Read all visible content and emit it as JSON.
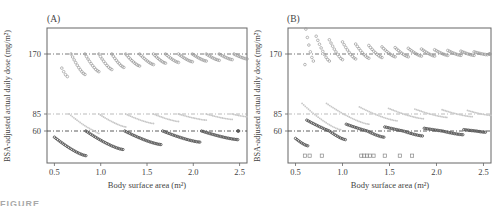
{
  "figure_caption": "FIGURE",
  "chart_data": [
    {
      "type": "scatter",
      "panel_label": "(A)",
      "title": "",
      "xlabel": "Body surface area (m²)",
      "ylabel": "BSA-adjusted actual daily dose (mg/m²)",
      "xlim": [
        0.42,
        2.58
      ],
      "xticks": [
        0.5,
        1.0,
        1.5,
        2.0,
        2.5
      ],
      "xtick_labels": [
        "0.5",
        "1.0",
        "1.5",
        "2.0",
        "2.5"
      ],
      "yticks": [
        60,
        85,
        170
      ],
      "ytick_labels": [
        "60",
        "85",
        "170"
      ],
      "reference_lines": [
        {
          "y": 170,
          "style": "dash-dot",
          "color": "#555555"
        },
        {
          "y": 85,
          "style": "dash-dot",
          "color": "#aaaaaa"
        },
        {
          "y": 60,
          "style": "dash-dot",
          "color": "#333333"
        }
      ],
      "grid": false,
      "series": [
        {
          "name": "target 170 mg/m²",
          "color": "#9a9a9a",
          "marker": "circle-open",
          "segments": [
            {
              "x0": 0.58,
              "x1": 0.64,
              "y0": 150,
              "y1": 138
            },
            {
              "x0": 0.68,
              "x1": 0.83,
              "y0": 170,
              "y1": 141
            },
            {
              "x0": 0.83,
              "x1": 0.98,
              "y0": 170,
              "y1": 145
            },
            {
              "x0": 0.98,
              "x1": 1.12,
              "y0": 170,
              "y1": 148
            },
            {
              "x0": 1.12,
              "x1": 1.25,
              "y0": 170,
              "y1": 151
            },
            {
              "x0": 1.27,
              "x1": 1.42,
              "y0": 170,
              "y1": 153
            },
            {
              "x0": 1.42,
              "x1": 1.57,
              "y0": 170,
              "y1": 155
            },
            {
              "x0": 1.57,
              "x1": 1.7,
              "y0": 170,
              "y1": 157
            },
            {
              "x0": 1.7,
              "x1": 1.84,
              "y0": 170,
              "y1": 158
            },
            {
              "x0": 1.84,
              "x1": 1.99,
              "y0": 170,
              "y1": 159
            },
            {
              "x0": 1.99,
              "x1": 2.14,
              "y0": 170,
              "y1": 160
            },
            {
              "x0": 2.14,
              "x1": 2.28,
              "y0": 170,
              "y1": 161
            },
            {
              "x0": 2.28,
              "x1": 2.42,
              "y0": 170,
              "y1": 162
            },
            {
              "x0": 2.44,
              "x1": 2.58,
              "y0": 170,
              "y1": 163
            }
          ]
        },
        {
          "name": "target 85 mg/m²",
          "color": "#c8c8c8",
          "marker": "circle-small",
          "segments": [
            {
              "x0": 0.66,
              "x1": 0.98,
              "y0": 85,
              "y1": 58
            },
            {
              "x0": 0.98,
              "x1": 1.27,
              "y0": 85,
              "y1": 66
            },
            {
              "x0": 1.27,
              "x1": 1.57,
              "y0": 85,
              "y1": 71
            },
            {
              "x0": 1.57,
              "x1": 1.84,
              "y0": 85,
              "y1": 74
            },
            {
              "x0": 1.84,
              "x1": 2.14,
              "y0": 85,
              "y1": 76
            },
            {
              "x0": 2.14,
              "x1": 2.42,
              "y0": 85,
              "y1": 77
            },
            {
              "x0": 2.42,
              "x1": 2.58,
              "y0": 85,
              "y1": 81
            }
          ]
        },
        {
          "name": "target 60 mg/m²",
          "color": "#555555",
          "marker": "circle-filled",
          "segments": [
            {
              "x0": 0.5,
              "x1": 0.84,
              "y0": 55,
              "y1": 40
            },
            {
              "x0": 0.84,
              "x1": 1.24,
              "y0": 60,
              "y1": 45
            },
            {
              "x0": 1.26,
              "x1": 1.65,
              "y0": 60,
              "y1": 49
            },
            {
              "x0": 1.67,
              "x1": 2.07,
              "y0": 60,
              "y1": 51
            },
            {
              "x0": 2.09,
              "x1": 2.48,
              "y0": 60,
              "y1": 53
            },
            {
              "x0": 2.48,
              "x1": 2.49,
              "y0": 60,
              "y1": 60
            }
          ]
        }
      ]
    },
    {
      "type": "scatter",
      "panel_label": "(B)",
      "title": "",
      "xlabel": "Body surface area (m²)",
      "ylabel": "BSA-adjusted actual daily dose (mg/m²)",
      "xlim": [
        0.42,
        2.58
      ],
      "xticks": [
        0.5,
        1.0,
        1.5,
        2.0,
        2.5
      ],
      "xtick_labels": [
        "0.5",
        "1.0",
        "1.5",
        "2.0",
        "2.5"
      ],
      "yticks": [
        60,
        85,
        170
      ],
      "ytick_labels": [
        "60",
        "85",
        "170"
      ],
      "reference_lines": [
        {
          "y": 170,
          "style": "dash-dot",
          "color": "#555555"
        },
        {
          "y": 85,
          "style": "dash-dot",
          "color": "#aaaaaa"
        },
        {
          "y": 60,
          "style": "dash-dot",
          "color": "#333333"
        }
      ],
      "grid": false,
      "series": [
        {
          "name": "target 170 mg/m²",
          "color": "#9a9a9a",
          "marker": "circle-open",
          "segments": [
            {
              "x0": 0.61,
              "x1": 0.69,
              "y0": 205,
              "y1": 160
            },
            {
              "x0": 0.72,
              "x1": 0.86,
              "y0": 195,
              "y1": 160
            },
            {
              "x0": 0.86,
              "x1": 1.0,
              "y0": 190,
              "y1": 162
            },
            {
              "x0": 1.0,
              "x1": 1.14,
              "y0": 187,
              "y1": 163
            },
            {
              "x0": 1.14,
              "x1": 1.28,
              "y0": 184,
              "y1": 164
            },
            {
              "x0": 1.28,
              "x1": 1.42,
              "y0": 182,
              "y1": 165
            },
            {
              "x0": 1.42,
              "x1": 1.56,
              "y0": 180,
              "y1": 166
            },
            {
              "x0": 1.56,
              "x1": 1.7,
              "y0": 179,
              "y1": 166
            },
            {
              "x0": 1.7,
              "x1": 1.84,
              "y0": 178,
              "y1": 167
            },
            {
              "x0": 1.84,
              "x1": 1.98,
              "y0": 177,
              "y1": 167
            },
            {
              "x0": 1.98,
              "x1": 2.12,
              "y0": 176,
              "y1": 168
            },
            {
              "x0": 2.12,
              "x1": 2.26,
              "y0": 175,
              "y1": 168
            },
            {
              "x0": 2.26,
              "x1": 2.4,
              "y0": 174,
              "y1": 168
            },
            {
              "x0": 2.4,
              "x1": 2.54,
              "y0": 173,
              "y1": 169
            },
            {
              "x0": 2.56,
              "x1": 2.57,
              "y0": 170,
              "y1": 170
            }
          ],
          "singletons": [
            {
              "x": 0.6,
              "y": 155
            }
          ]
        },
        {
          "name": "target 85 mg/m²",
          "color": "#c8c8c8",
          "marker": "circle-small",
          "segments": [
            {
              "x0": 0.57,
              "x1": 0.98,
              "y0": 100,
              "y1": 62
            },
            {
              "x0": 0.83,
              "x1": 1.28,
              "y0": 100,
              "y1": 70
            },
            {
              "x0": 1.18,
              "x1": 1.58,
              "y0": 95,
              "y1": 75
            },
            {
              "x0": 1.49,
              "x1": 1.86,
              "y0": 93,
              "y1": 78
            },
            {
              "x0": 1.77,
              "x1": 2.11,
              "y0": 92,
              "y1": 80
            },
            {
              "x0": 2.06,
              "x1": 2.38,
              "y0": 91,
              "y1": 81
            },
            {
              "x0": 2.33,
              "x1": 2.58,
              "y0": 90,
              "y1": 83
            }
          ]
        },
        {
          "name": "target 60 mg/m²",
          "color": "#555555",
          "marker": "circle-filled",
          "segments": [
            {
              "x0": 0.5,
              "x1": 0.63,
              "y0": 54,
              "y1": 48
            },
            {
              "x0": 0.62,
              "x1": 1.03,
              "y0": 76,
              "y1": 53
            },
            {
              "x0": 1.04,
              "x1": 1.44,
              "y0": 70,
              "y1": 55
            },
            {
              "x0": 1.45,
              "x1": 1.85,
              "y0": 66,
              "y1": 56
            },
            {
              "x0": 1.87,
              "x1": 2.28,
              "y0": 64,
              "y1": 57
            },
            {
              "x0": 2.29,
              "x1": 2.52,
              "y0": 62,
              "y1": 59
            }
          ]
        },
        {
          "name": "low-dose outliers",
          "color": "#888888",
          "marker": "square-open",
          "points": [
            {
              "x": 0.6,
              "y": 40
            },
            {
              "x": 0.65,
              "y": 40
            },
            {
              "x": 0.78,
              "y": 40
            },
            {
              "x": 1.2,
              "y": 40
            },
            {
              "x": 1.23,
              "y": 40
            },
            {
              "x": 1.26,
              "y": 40
            },
            {
              "x": 1.29,
              "y": 40
            },
            {
              "x": 1.33,
              "y": 40
            },
            {
              "x": 1.45,
              "y": 40
            },
            {
              "x": 1.61,
              "y": 40
            },
            {
              "x": 1.74,
              "y": 40
            }
          ]
        }
      ]
    }
  ]
}
